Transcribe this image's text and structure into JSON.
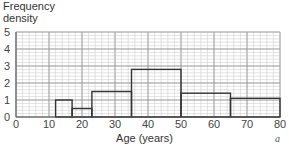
{
  "chart_data": {
    "type": "bar",
    "subtype": "histogram",
    "title": "",
    "xlabel": "Age (years)",
    "ylabel": "Frequency density",
    "xlim": [
      0,
      80
    ],
    "ylim": [
      0,
      5
    ],
    "x_ticks": [
      0,
      10,
      20,
      30,
      40,
      50,
      60,
      70,
      80
    ],
    "y_ticks": [
      0,
      1,
      2,
      3,
      4,
      5
    ],
    "grid": true,
    "grid_minor_divisions": 5,
    "legend": null,
    "bins": [
      {
        "from": 12,
        "to": 17,
        "density": 1.0
      },
      {
        "from": 17,
        "to": 23,
        "density": 0.5
      },
      {
        "from": 23,
        "to": 35,
        "density": 1.5
      },
      {
        "from": 35,
        "to": 50,
        "density": 2.8
      },
      {
        "from": 50,
        "to": 65,
        "density": 1.4
      },
      {
        "from": 65,
        "to": 80,
        "density": 1.1
      }
    ],
    "annotations": [
      "a"
    ]
  },
  "labels": {
    "ylabel_line1": "Frequency",
    "ylabel_line2": "density",
    "xlabel": "Age (years)",
    "corner_mark": "a"
  },
  "colors": {
    "grid_major": "#9a9a9a",
    "grid_minor": "#cfcfcf",
    "bar_outline": "#333333"
  }
}
